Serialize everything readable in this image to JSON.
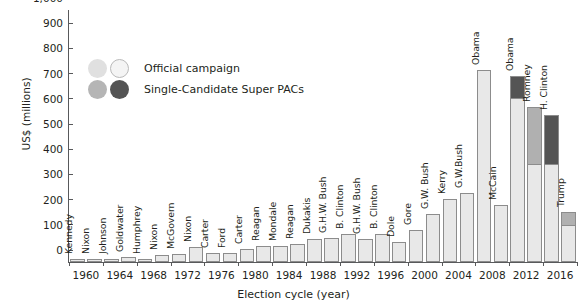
{
  "chart_data": {
    "type": "bar",
    "title": "",
    "xlabel": "Election cycle (year)",
    "ylabel": "US$ (millions)",
    "ylim": [
      0,
      1000
    ],
    "yticks": [
      0,
      100,
      200,
      300,
      400,
      500,
      600,
      700,
      800,
      900,
      1000
    ],
    "ytick_labels": [
      "0",
      "100",
      "200",
      "300",
      "400",
      "500",
      "600",
      "700",
      "800",
      "900",
      "1,000"
    ],
    "x": [
      1960,
      1964,
      1968,
      1972,
      1976,
      1980,
      1984,
      1988,
      1992,
      1996,
      2000,
      2004,
      2008,
      2012,
      2016
    ],
    "xtick_labels": [
      "1960",
      "1964",
      "1968",
      "1972",
      "1976",
      "1980",
      "1984",
      "1988",
      "1992",
      "1996",
      "2000",
      "2004",
      "2008",
      "2012",
      "2016"
    ],
    "grid": false,
    "legend_position": "upper-left-inside",
    "series": [
      {
        "name": "Official campaign",
        "color": "#e8e8e8"
      },
      {
        "name": "Single-Candidate Super PACs",
        "color": "#545454"
      }
    ],
    "bars": [
      {
        "cycle": "1960",
        "candidate": "Kennedy",
        "official": 10,
        "super_pac": 0,
        "total": 10
      },
      {
        "cycle": "1960",
        "candidate": "Nixon",
        "official": 10,
        "super_pac": 0,
        "total": 10
      },
      {
        "cycle": "1964",
        "candidate": "Johnson",
        "official": 12,
        "super_pac": 0,
        "total": 12
      },
      {
        "cycle": "1964",
        "candidate": "Goldwater",
        "official": 20,
        "super_pac": 0,
        "total": 20
      },
      {
        "cycle": "1968",
        "candidate": "Humphrey",
        "official": 12,
        "super_pac": 0,
        "total": 12
      },
      {
        "cycle": "1968",
        "candidate": "Nixon",
        "official": 26,
        "super_pac": 0,
        "total": 26
      },
      {
        "cycle": "1972",
        "candidate": "McGovern",
        "official": 32,
        "super_pac": 0,
        "total": 32
      },
      {
        "cycle": "1972",
        "candidate": "Nixon",
        "official": 60,
        "super_pac": 0,
        "total": 60
      },
      {
        "cycle": "1976",
        "candidate": "Carter",
        "official": 35,
        "super_pac": 0,
        "total": 35
      },
      {
        "cycle": "1976",
        "candidate": "Ford",
        "official": 35,
        "super_pac": 0,
        "total": 35
      },
      {
        "cycle": "1980",
        "candidate": "Carter",
        "official": 50,
        "super_pac": 0,
        "total": 50
      },
      {
        "cycle": "1980",
        "candidate": "Reagan",
        "official": 62,
        "super_pac": 0,
        "total": 62
      },
      {
        "cycle": "1984",
        "candidate": "Mondale",
        "official": 65,
        "super_pac": 0,
        "total": 65
      },
      {
        "cycle": "1984",
        "candidate": "Reagan",
        "official": 72,
        "super_pac": 0,
        "total": 72
      },
      {
        "cycle": "1988",
        "candidate": "Dukakis",
        "official": 93,
        "super_pac": 0,
        "total": 93
      },
      {
        "cycle": "1988",
        "candidate": "G.H.W. Bush",
        "official": 95,
        "super_pac": 0,
        "total": 95
      },
      {
        "cycle": "1992",
        "candidate": "B. Clinton",
        "official": 110,
        "super_pac": 0,
        "total": 110
      },
      {
        "cycle": "1992",
        "candidate": "G.H.W. Bush",
        "official": 92,
        "super_pac": 0,
        "total": 92
      },
      {
        "cycle": "1996",
        "candidate": "B. Clinton",
        "official": 110,
        "super_pac": 0,
        "total": 110
      },
      {
        "cycle": "1996",
        "candidate": "Dole",
        "official": 78,
        "super_pac": 0,
        "total": 78
      },
      {
        "cycle": "2000",
        "candidate": "Gore",
        "official": 128,
        "super_pac": 0,
        "total": 128
      },
      {
        "cycle": "2000",
        "candidate": "G.W. Bush",
        "official": 190,
        "super_pac": 0,
        "total": 190
      },
      {
        "cycle": "2004",
        "candidate": "Kerry",
        "official": 250,
        "super_pac": 0,
        "total": 250
      },
      {
        "cycle": "2004",
        "candidate": "G.W.Bush",
        "official": 272,
        "super_pac": 0,
        "total": 272
      },
      {
        "cycle": "2008",
        "candidate": "Obama",
        "official": 760,
        "super_pac": 0,
        "total": 760
      },
      {
        "cycle": "2008",
        "candidate": "McCain",
        "official": 228,
        "super_pac": 0,
        "total": 228
      },
      {
        "cycle": "2012",
        "candidate": "Obama",
        "official": 652,
        "super_pac": 88,
        "total": 740,
        "pac_shade": "dark"
      },
      {
        "cycle": "2012",
        "candidate": "Romney",
        "official": 390,
        "super_pac": 225,
        "total": 615,
        "pac_shade": "mid"
      },
      {
        "cycle": "2016",
        "candidate": "H. Clinton",
        "official": 390,
        "super_pac": 195,
        "total": 585,
        "pac_shade": "dark"
      },
      {
        "cycle": "2016",
        "candidate": "Trump",
        "official": 145,
        "super_pac": 55,
        "total": 200,
        "pac_shade": "mid"
      }
    ]
  },
  "legend": {
    "rows": [
      {
        "label": "Official campaign"
      },
      {
        "label": "Single-Candidate Super PACs"
      }
    ]
  }
}
